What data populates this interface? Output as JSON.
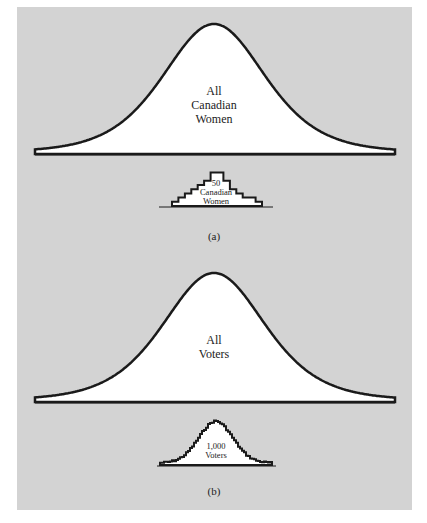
{
  "colors": {
    "panel_background": "#d3d3d3",
    "curve_fill": "#ffffff",
    "stroke": "#1a1a1a"
  },
  "panel_a": {
    "population_label_lines": [
      "All",
      "Canadian",
      "Women"
    ],
    "sample_label_lines": [
      "50",
      "Canadian",
      "Women"
    ],
    "caption": "(a)",
    "sample_histogram_counts": [
      1,
      2,
      3,
      4,
      5,
      6,
      8,
      8,
      6,
      4,
      3,
      2,
      2,
      1
    ]
  },
  "panel_b": {
    "population_label_lines": [
      "All",
      "Voters"
    ],
    "sample_label_lines": [
      "1,000",
      "Voters"
    ],
    "caption": "(b)"
  }
}
